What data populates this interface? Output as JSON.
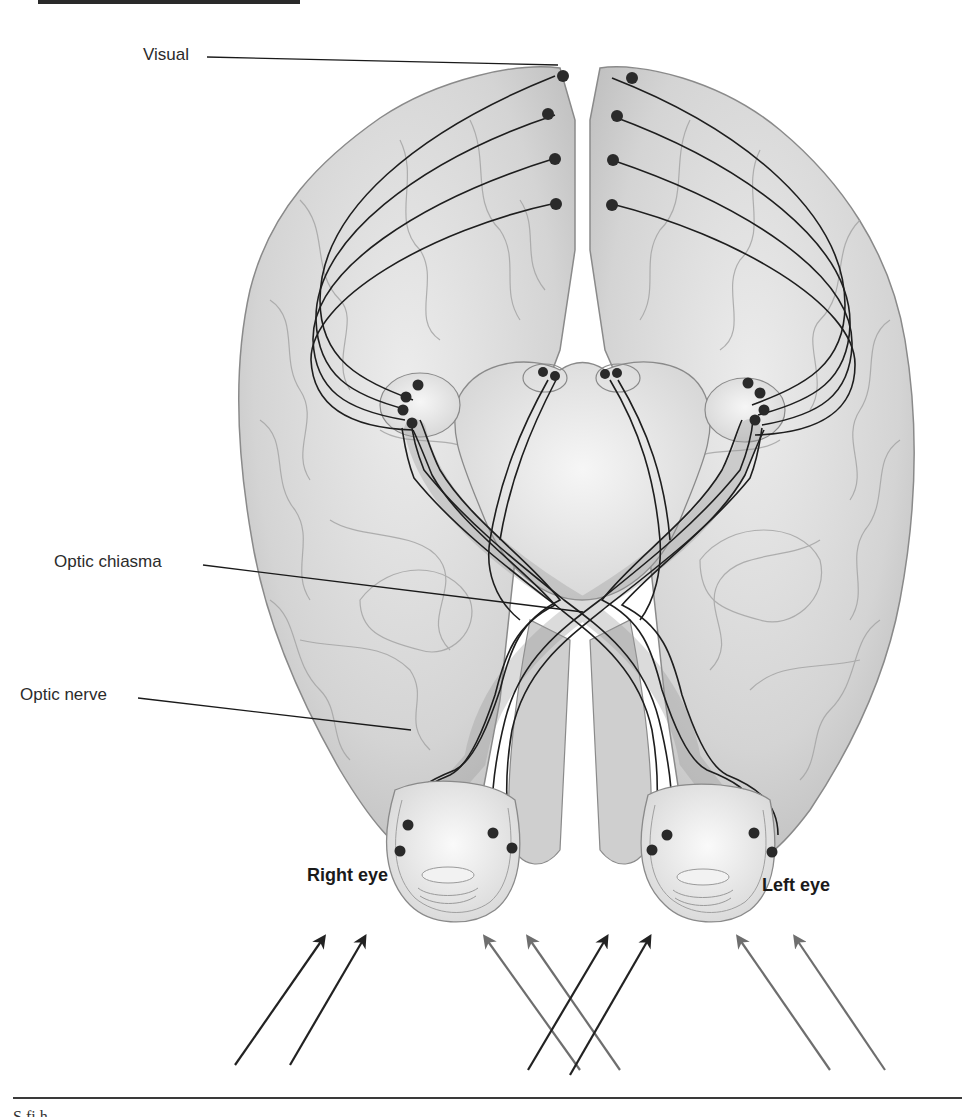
{
  "figure": {
    "type": "anatomical-diagram",
    "labels": {
      "visual": "Visual",
      "optic_chiasma": "Optic chiasma",
      "optic_nerve": "Optic nerve",
      "right_eye": "Right eye",
      "left_eye": "Left eye"
    },
    "caption_fragment": "S    fi              h   "
  },
  "colors": {
    "brain_fill": "#d9d9d9",
    "brain_stroke": "#8a8a8a",
    "fiber": "#1e1e1e",
    "neuron_dot": "#2a2a2a",
    "arrow_dark": "#222222",
    "arrow_gray": "#6e6e6e"
  },
  "arrows": [
    {
      "from": [
        235,
        1065
      ],
      "to": [
        325,
        935
      ],
      "shade": "dark"
    },
    {
      "from": [
        290,
        1065
      ],
      "to": [
        365,
        935
      ],
      "shade": "dark"
    },
    {
      "from": [
        580,
        1070
      ],
      "to": [
        485,
        935
      ],
      "shade": "gray"
    },
    {
      "from": [
        620,
        1070
      ],
      "to": [
        530,
        935
      ],
      "shade": "gray"
    },
    {
      "from": [
        528,
        1070
      ],
      "to": [
        607,
        935
      ],
      "shade": "dark"
    },
    {
      "from": [
        570,
        1075
      ],
      "to": [
        650,
        935
      ],
      "shade": "dark"
    },
    {
      "from": [
        830,
        1070
      ],
      "to": [
        738,
        935
      ],
      "shade": "gray"
    },
    {
      "from": [
        885,
        1070
      ],
      "to": [
        795,
        935
      ],
      "shade": "gray"
    }
  ]
}
